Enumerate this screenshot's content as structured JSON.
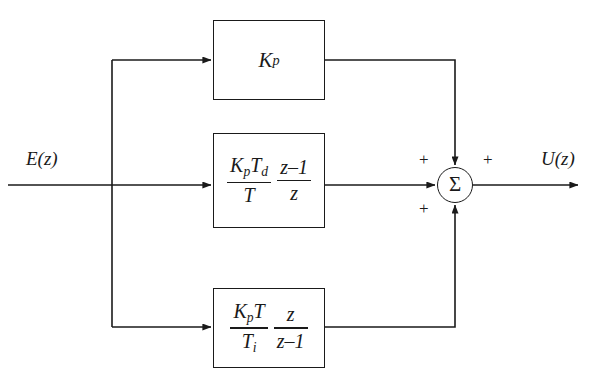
{
  "diagram": {
    "input_signal": {
      "label": "E(z)",
      "name": "error-signal"
    },
    "output_signal": {
      "label": "U(z)",
      "name": "control-signal"
    },
    "summing_junction": {
      "symbol": "Σ",
      "signs": [
        {
          "position": "top-left",
          "label": "+"
        },
        {
          "position": "top-right",
          "label": "+"
        },
        {
          "position": "bottom-left",
          "label": "+"
        }
      ]
    },
    "blocks": [
      {
        "id": "proportional",
        "name": "proportional-gain-block",
        "expression": "K_p",
        "parts": {
          "gain_base": "K",
          "gain_sub": "p"
        }
      },
      {
        "id": "derivative",
        "name": "derivative-term-block",
        "expression": "(K_p T_d / T) * (z-1)/z",
        "parts": {
          "frac1_num_base": "K",
          "frac1_num_sub1": "p",
          "frac1_num_base2": "T",
          "frac1_num_sub2": "d",
          "frac1_den": "T",
          "frac2_num": "z–1",
          "frac2_den": "z"
        }
      },
      {
        "id": "integral",
        "name": "integral-term-block",
        "expression": "(K_p T / T_i) * z/(z-1)",
        "parts": {
          "frac1_num_base": "K",
          "frac1_num_sub1": "p",
          "frac1_num_base2": "T",
          "frac1_den_base": "T",
          "frac1_den_sub": "i",
          "frac2_num": "z",
          "frac2_den": "z–1"
        }
      }
    ],
    "colors": {
      "line": "#1a1a1a",
      "background": "#ffffff"
    }
  }
}
